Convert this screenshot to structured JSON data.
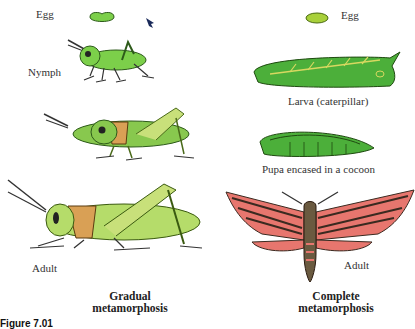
{
  "diagram": {
    "left_column": {
      "title_line1": "Gradual",
      "title_line2": "metamorphosis",
      "stages": [
        {
          "label": "Egg"
        },
        {
          "label": "Nymph"
        },
        {
          "label": ""
        },
        {
          "label": "Adult"
        }
      ]
    },
    "right_column": {
      "title_line1": "Complete",
      "title_line2": "metamorphosis",
      "stages": [
        {
          "label": "Egg"
        },
        {
          "label": "Larva (caterpillar)"
        },
        {
          "label": "Pupa encased in a cocoon"
        },
        {
          "label": "Adult"
        }
      ]
    },
    "caption_prefix": "Figure 7.01",
    "colors": {
      "grasshopper_green": "#7ccf4a",
      "grasshopper_adult": "#b5dc6a",
      "pronotum_orange": "#d9a055",
      "caterpillar_green": "#4caf3a",
      "moth_pink": "#e7766e",
      "moth_dark": "#3a2a20"
    }
  }
}
